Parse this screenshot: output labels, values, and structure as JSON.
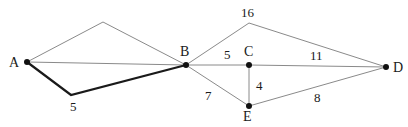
{
  "diagram": {
    "type": "weighted-graph",
    "colors": {
      "thin_edge": "#8a8a8a",
      "bold_edge": "#1a1a1a",
      "node": "#111111",
      "text": "#1a1a1a",
      "background": "#ffffff"
    },
    "nodes": [
      {
        "id": "A",
        "label": "A",
        "x": 27,
        "y": 62,
        "lx": 9,
        "ly": 67
      },
      {
        "id": "B",
        "label": "B",
        "x": 186,
        "y": 65,
        "lx": 180,
        "ly": 56
      },
      {
        "id": "C",
        "label": "C",
        "x": 249,
        "y": 65,
        "lx": 244,
        "ly": 56
      },
      {
        "id": "D",
        "label": "D",
        "x": 386,
        "y": 67,
        "lx": 393,
        "ly": 72
      },
      {
        "id": "E",
        "label": "E",
        "x": 249,
        "y": 106,
        "lx": 243,
        "ly": 121
      }
    ],
    "edges": [
      {
        "id": "A-B-upper",
        "from": "A",
        "to": "B",
        "via": [
          103,
          22
        ],
        "weight": "",
        "bold": false
      },
      {
        "id": "A-B-direct",
        "from": "A",
        "to": "B",
        "via": null,
        "weight": "",
        "bold": false
      },
      {
        "id": "A-B-lower",
        "from": "A",
        "to": "B",
        "via": [
          71,
          95
        ],
        "weight": "5",
        "wx": 70,
        "wy": 111,
        "bold": true
      },
      {
        "id": "B-D-upper",
        "from": "B",
        "to": "D",
        "via": [
          249,
          23
        ],
        "weight": "16",
        "wx": 241,
        "wy": 17,
        "bold": false
      },
      {
        "id": "B-C",
        "from": "B",
        "to": "C",
        "via": null,
        "weight": "5",
        "wx": 224,
        "wy": 59,
        "bold": false
      },
      {
        "id": "C-D",
        "from": "C",
        "to": "D",
        "via": null,
        "weight": "11",
        "wx": 310,
        "wy": 60,
        "bold": false
      },
      {
        "id": "C-E",
        "from": "C",
        "to": "E",
        "via": null,
        "weight": "4",
        "wx": 256,
        "wy": 90,
        "bold": false
      },
      {
        "id": "B-E",
        "from": "B",
        "to": "E",
        "via": null,
        "weight": "7",
        "wx": 205,
        "wy": 100,
        "bold": false
      },
      {
        "id": "E-D",
        "from": "E",
        "to": "D",
        "via": null,
        "weight": "8",
        "wx": 314,
        "wy": 102,
        "bold": false
      }
    ]
  }
}
